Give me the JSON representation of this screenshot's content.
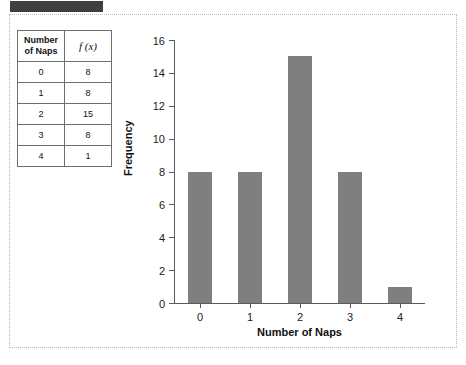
{
  "topbar": {
    "label": ""
  },
  "table": {
    "headers": [
      "Number of Naps",
      "f (x)"
    ],
    "header_line1": "Number",
    "header_line2": "of Naps",
    "rows": [
      {
        "naps": "0",
        "fx": "8"
      },
      {
        "naps": "1",
        "fx": "8"
      },
      {
        "naps": "2",
        "fx": "15"
      },
      {
        "naps": "3",
        "fx": "8"
      },
      {
        "naps": "4",
        "fx": "1"
      }
    ]
  },
  "chart_data": {
    "type": "bar",
    "title": "",
    "categories": [
      "0",
      "1",
      "2",
      "3",
      "4"
    ],
    "values": [
      8,
      8,
      15,
      8,
      1
    ],
    "xlabel": "Number of Naps",
    "ylabel": "Frequency",
    "ylim": [
      0,
      16
    ],
    "yticks": [
      "0",
      "2",
      "4",
      "6",
      "8",
      "10",
      "12",
      "14",
      "16"
    ],
    "ytick_values": [
      0,
      2,
      4,
      6,
      8,
      10,
      12,
      14,
      16
    ],
    "xticks": [
      "0",
      "1",
      "2",
      "3",
      "4"
    ],
    "grid": false,
    "legend": null,
    "bar_color": "#7f7f7f",
    "axis_color": "#5a5a5a"
  }
}
